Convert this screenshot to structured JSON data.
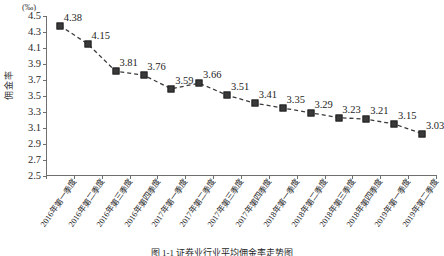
{
  "chart_data": {
    "type": "line",
    "title": "",
    "caption": "图 1-1 证券业行业平均佣金率走势图",
    "xlabel": "",
    "ylabel": "佣金率",
    "unit_label": "(‰)",
    "ylim": [
      2.5,
      4.5
    ],
    "ytick_step": 0.2,
    "grid": false,
    "legend": "none",
    "marker": "square",
    "line_style": "dashed",
    "series_color": "#3a3a3a",
    "axis_color": "#6f6f6f",
    "yticks": [
      "4.5",
      "4.3",
      "4.1",
      "3.9",
      "3.7",
      "3.5",
      "3.3",
      "3.1",
      "2.9",
      "2.7",
      "2.5"
    ],
    "categories": [
      "2016年第一季度",
      "2016年第二季度",
      "2016年第三季度",
      "2016年第四季度",
      "2017年第一季度",
      "2017年第二季度",
      "2017年第三季度",
      "2017年第四季度",
      "2018年第一季度",
      "2018年第二季度",
      "2018年第三季度",
      "2018年第四季度",
      "2019年第一季度",
      "2019年第二季度"
    ],
    "values": [
      4.38,
      4.15,
      3.81,
      3.76,
      3.59,
      3.66,
      3.51,
      3.41,
      3.35,
      3.29,
      3.23,
      3.21,
      3.15,
      3.03
    ],
    "data_labels": [
      "4.38",
      "4.15",
      "3.81",
      "3.76",
      "3.59",
      "3.66",
      "3.51",
      "3.41",
      "3.35",
      "3.29",
      "3.23",
      "3.21",
      "3.15",
      "3.03"
    ]
  }
}
